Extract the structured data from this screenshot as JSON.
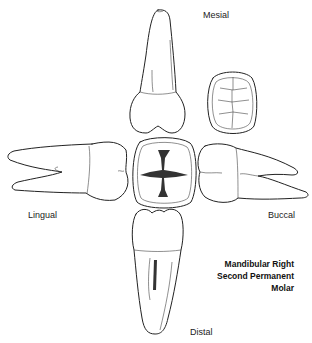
{
  "figure": {
    "title_lines": [
      "Mandibular Right",
      "Second Permanent",
      "Molar"
    ],
    "views": {
      "mesial": "Mesial",
      "distal": "Distal",
      "lingual": "Lingual",
      "buccal": "Buccal"
    },
    "drawings": [
      {
        "name": "mesial-view-tooth",
        "position": "top-center"
      },
      {
        "name": "incisal-outline-view",
        "position": "top-right"
      },
      {
        "name": "occlusal-view-tooth",
        "position": "center"
      },
      {
        "name": "lingual-view-tooth",
        "position": "left"
      },
      {
        "name": "buccal-view-tooth",
        "position": "right"
      },
      {
        "name": "distal-view-tooth",
        "position": "bottom-center"
      }
    ]
  }
}
